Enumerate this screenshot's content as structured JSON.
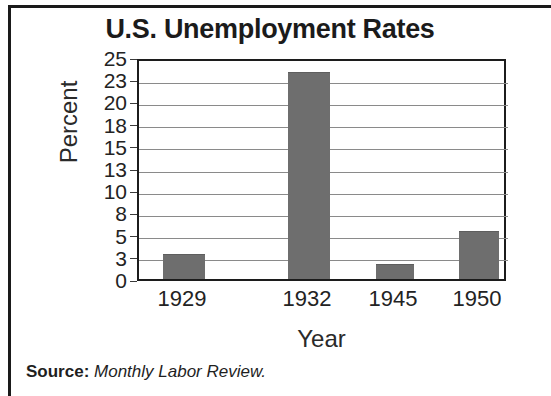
{
  "figure": {
    "title": "U.S. Unemployment Rates",
    "source_label": "Source:",
    "source_name": "Monthly Labor Review."
  },
  "chart_data": {
    "type": "bar",
    "title": "U.S. Unemployment Rates",
    "xlabel": "Year",
    "ylabel": "Percent",
    "categories": [
      "1929",
      "1932",
      "1945",
      "1950"
    ],
    "values": [
      3.2,
      23.6,
      1.9,
      5.3
    ],
    "value_unit": "percent",
    "ytick_labels": [
      "25",
      "23",
      "20",
      "18",
      "15",
      "13",
      "10",
      "8",
      "5",
      "3",
      "0"
    ],
    "ytick_values": [
      25,
      23,
      20,
      18,
      15,
      13,
      10,
      8,
      5,
      3,
      0
    ],
    "ylim": [
      0,
      25
    ],
    "grid": true,
    "legend": false,
    "bar_color": "#6e6e6e",
    "series": [
      {
        "name": "Unemployment rate",
        "values": [
          3.2,
          23.6,
          1.9,
          5.3
        ]
      }
    ]
  }
}
